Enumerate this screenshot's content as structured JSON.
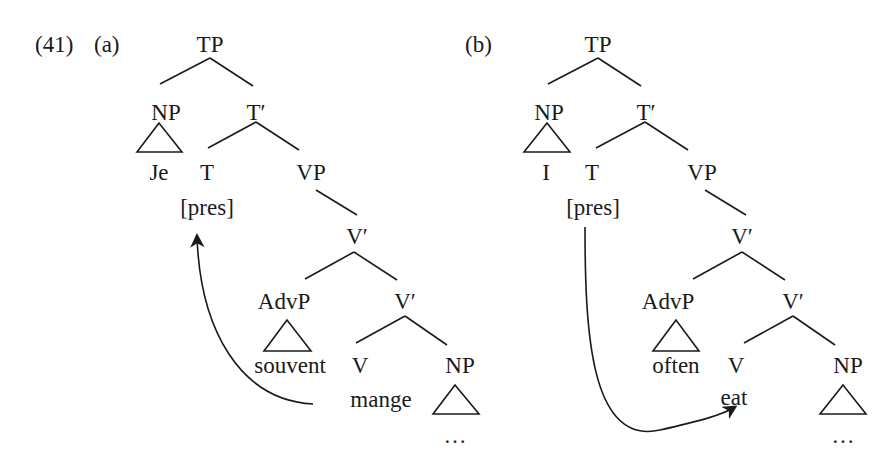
{
  "example_number": "(41)",
  "trees": [
    {
      "label": "(a)",
      "language": "French",
      "nodes": {
        "TP": "TP",
        "NP_subj": "NP",
        "T_bar": "T′",
        "T": "T",
        "VP": "VP",
        "V_bar_upper": "V′",
        "AdvP": "AdvP",
        "V_bar_lower": "V′",
        "V": "V",
        "NP_obj": "NP"
      },
      "leaves": {
        "subject": "Je",
        "tense": "[pres]",
        "adverb": "souvent",
        "verb": "mange",
        "object": "…"
      },
      "movement": "V raises to T (arrow from 'mange' up to [pres])"
    },
    {
      "label": "(b)",
      "language": "English",
      "nodes": {
        "TP": "TP",
        "NP_subj": "NP",
        "T_bar": "T′",
        "T": "T",
        "VP": "VP",
        "V_bar_upper": "V′",
        "AdvP": "AdvP",
        "V_bar_lower": "V′",
        "V": "V",
        "NP_obj": "NP"
      },
      "leaves": {
        "subject": "I",
        "tense": "[pres]",
        "adverb": "often",
        "verb": "eat",
        "object": "…"
      },
      "movement": "T lowers to V (arrow from [pres] down to 'eat')"
    }
  ],
  "colors": {
    "ink": "#1a1a1a",
    "background": "#ffffff"
  }
}
